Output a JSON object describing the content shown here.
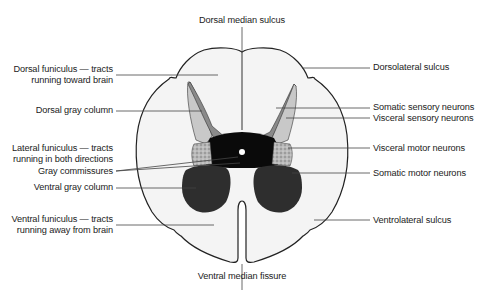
{
  "diagram": {
    "colors": {
      "white_matter": "#f4f4f4",
      "outline": "#222222",
      "dorsal_horn_dark": "#8a8a8a",
      "dorsal_horn_light": "#c8c8c8",
      "central_gray": "#0a0a0a",
      "visceral_motor": "#b0b0b0",
      "ventral_horn": "#2e2e2e",
      "leader_line": "#444444"
    },
    "labels": {
      "top": {
        "dorsal_median_sulcus": "Dorsal median sulcus"
      },
      "bottom": {
        "ventral_median_fissure": "Ventral median fissure"
      },
      "left": [
        {
          "id": "dorsal-funiculus",
          "line1": "Dorsal funiculus — tracts",
          "line2": "running toward brain"
        },
        {
          "id": "dorsal-gray-column",
          "line1": "Dorsal gray column"
        },
        {
          "id": "lateral-funiculus",
          "line1": "Lateral funiculus — tracts",
          "line2": "running in both directions"
        },
        {
          "id": "gray-commissures",
          "line1": "Gray commissures"
        },
        {
          "id": "ventral-gray-column",
          "line1": "Ventral gray column"
        },
        {
          "id": "ventral-funiculus",
          "line1": "Ventral funiculus — tracts",
          "line2": "running away from brain"
        }
      ],
      "right": [
        {
          "id": "dorsolateral-sulcus",
          "line1": "Dorsolateral sulcus"
        },
        {
          "id": "somatic-sensory-neurons",
          "line1": "Somatic sensory neurons"
        },
        {
          "id": "visceral-sensory-neurons",
          "line1": "Visceral sensory neurons"
        },
        {
          "id": "visceral-motor-neurons",
          "line1": "Visceral motor neurons"
        },
        {
          "id": "somatic-motor-neurons",
          "line1": "Somatic motor neurons"
        },
        {
          "id": "ventrolateral-sulcus",
          "line1": "Ventrolateral sulcus"
        }
      ]
    }
  }
}
